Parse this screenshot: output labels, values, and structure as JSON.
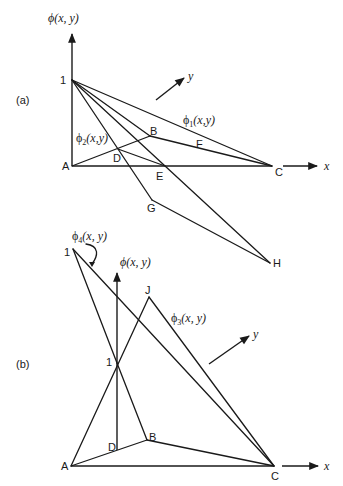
{
  "figure": {
    "panel_a": {
      "tag": "(a)",
      "axis_phi_label": "ϕ(x, y)",
      "axis_x_label": "x",
      "axis_y_label": "y",
      "apex_label": "1",
      "points": {
        "A": "A",
        "B": "B",
        "C": "C",
        "D": "D",
        "E": "E",
        "F": "F",
        "G": "G",
        "H": "H"
      },
      "functions": {
        "phi1": {
          "symbol": "ϕ",
          "sub": "1",
          "args": "(x,y)"
        },
        "phi2": {
          "symbol": "ϕ",
          "sub": "2",
          "args": "(x,y)"
        }
      }
    },
    "panel_b": {
      "tag": "(b)",
      "axis_phi_label": "ϕ(x, y)",
      "axis_x_label": "x",
      "axis_y_label": "y",
      "apex_label_left": "1",
      "apex_label_center": "1",
      "points": {
        "A": "A",
        "B": "B",
        "C": "C",
        "D": "D",
        "J": "J"
      },
      "functions": {
        "phi3": {
          "symbol": "ϕ",
          "sub": "3",
          "args": "(x, y)"
        },
        "phi4": {
          "symbol": "ϕ",
          "sub": "4",
          "args": "(x, y)"
        }
      }
    }
  }
}
